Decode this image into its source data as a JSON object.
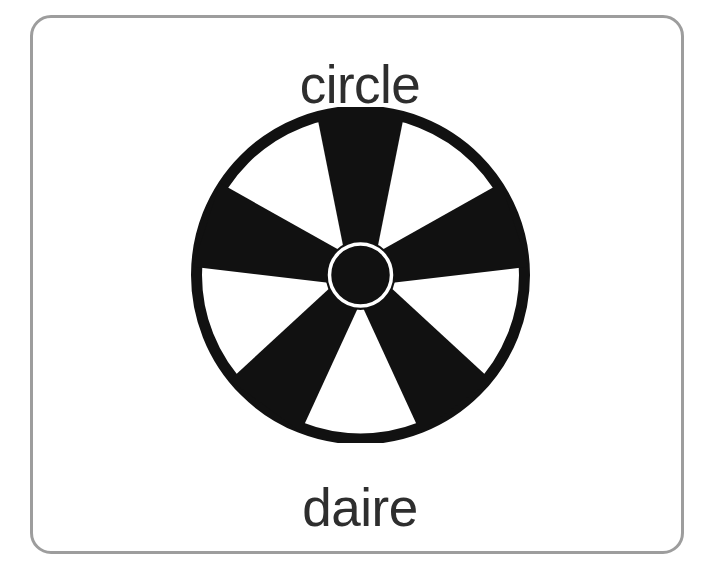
{
  "card": {
    "name": "vocabulary-flashcard",
    "background_color": "#ffffff",
    "border_color": "#9d9d9d",
    "english_word": "circle",
    "turkish_word": "daire",
    "text_color": "#2e2e2e"
  },
  "figure": {
    "icon_name": "wheel-icon",
    "description": "circle",
    "fill_color": "#111111",
    "hub_ring_color": "#ffffff",
    "spoke_count": 5
  }
}
